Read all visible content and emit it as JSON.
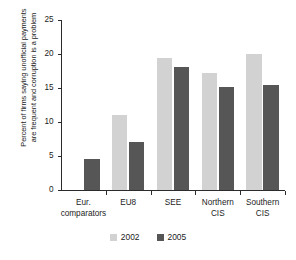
{
  "chart_data": {
    "type": "bar",
    "title": "",
    "xlabel": "",
    "ylabel_line1": "Percent of firms saying unofficial payments",
    "ylabel_line2": "are frequent and corruption is a problem",
    "categories": [
      "Eur. comparators",
      "EU8",
      "SEE",
      "Northern CIS",
      "Southern CIS"
    ],
    "category_lines": [
      [
        "Eur.",
        "comparators"
      ],
      [
        "EU8"
      ],
      [
        "SEE"
      ],
      [
        "Northern",
        "CIS"
      ],
      [
        "Southern",
        "CIS"
      ]
    ],
    "series": [
      {
        "name": "2002",
        "color": "#d2d2d2",
        "values": [
          0,
          11.0,
          19.4,
          17.2,
          20.0
        ]
      },
      {
        "name": "2005",
        "color": "#565656",
        "values": [
          4.5,
          7.0,
          18.1,
          15.1,
          15.5
        ]
      }
    ],
    "ylim": [
      0,
      25
    ],
    "yticks": [
      0,
      5,
      10,
      15,
      20,
      25
    ],
    "ytick_labels": [
      "0",
      "5",
      "10",
      "15",
      "20",
      "25"
    ],
    "grid": false,
    "legend_position": "bottom-center"
  },
  "legend": {
    "entries": [
      {
        "label": "2002"
      },
      {
        "label": "2005"
      }
    ]
  }
}
